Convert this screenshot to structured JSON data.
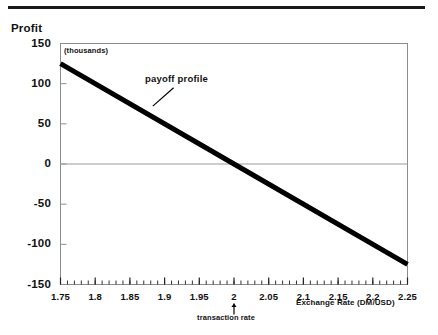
{
  "chart_data": {
    "type": "line",
    "title": "",
    "subtitle": "",
    "units_note": "(thousands)",
    "ylabel": "Profit",
    "xlabel": "Exchange Rate (DM/USD)",
    "xlim": [
      1.75,
      2.25
    ],
    "ylim": [
      -150,
      150
    ],
    "grid": false,
    "zero_line": true,
    "x_ticks": [
      1.75,
      1.8,
      1.85,
      1.9,
      1.95,
      2,
      2.05,
      2.1,
      2.15,
      2.2,
      2.25
    ],
    "x_tick_labels": [
      "1.75",
      "1.8",
      "1.85",
      "1.9",
      "1.95",
      "2",
      "2.05",
      "2.1",
      "2.15",
      "2.2",
      "2.25"
    ],
    "x_minor_tick_step": 0.01,
    "y_ticks": [
      150,
      100,
      50,
      0,
      -50,
      -100,
      -150
    ],
    "y_tick_labels": [
      "150",
      "100",
      "50",
      "0",
      "-50",
      "-100",
      "-150"
    ],
    "series": [
      {
        "name": "payoff profile",
        "color": "#000000",
        "line_width": 5,
        "x": [
          1.75,
          2.0,
          2.25
        ],
        "values": [
          125,
          0,
          -125
        ]
      }
    ],
    "annotations": [
      {
        "name": "payoff-profile-callout",
        "text": "payoff profile",
        "x": 1.913,
        "y": 95,
        "leader_from_x": 1.883,
        "leader_from_y": 72
      },
      {
        "name": "transaction-rate-marker",
        "text": "transaction rate",
        "x": 2.0,
        "y": -150,
        "marker": "up-arrow"
      }
    ]
  },
  "axis": {
    "y_title": "Profit",
    "x_title": "Exchange Rate (DM/USD)",
    "units_note": "(thousands)"
  },
  "labels": {
    "payoff_profile": "payoff profile",
    "transaction_rate": "transaction rate"
  },
  "colors": {
    "line": "#000000",
    "frame": "#8c8c8c",
    "rule": "#1a1a1a",
    "text": "#111111",
    "zero_line": "#9a9a9a"
  }
}
